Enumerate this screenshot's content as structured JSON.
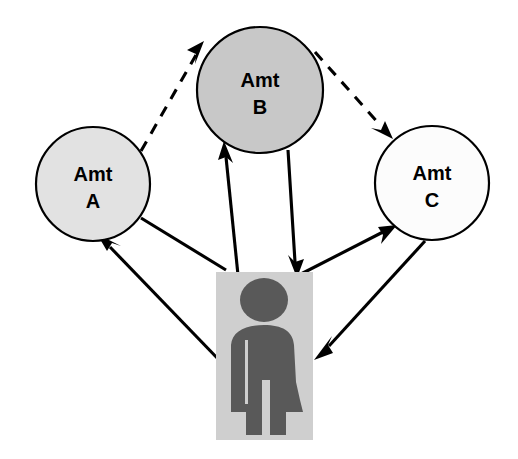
{
  "diagram": {
    "type": "node-link-diagram",
    "background_color": "#ffffff",
    "nodes": [
      {
        "id": "amt-a",
        "label_line1": "Amt",
        "label_line2": "A",
        "shape": "circle",
        "cx": 93,
        "cy": 184,
        "r": 57,
        "fill": "#e2e2e2",
        "stroke": "#000000"
      },
      {
        "id": "amt-b",
        "label_line1": "Amt",
        "label_line2": "B",
        "shape": "circle",
        "cx": 260,
        "cy": 90,
        "r": 63,
        "fill": "#c8c8c8",
        "stroke": "#000000"
      },
      {
        "id": "amt-c",
        "label_line1": "Amt",
        "label_line2": "C",
        "shape": "circle",
        "cx": 432,
        "cy": 183,
        "r": 57,
        "fill": "#fcfcfc",
        "stroke": "#000000"
      }
    ],
    "citizen": {
      "id": "citizen",
      "shape": "rectangle",
      "x": 216,
      "y": 272,
      "width": 97,
      "height": 168,
      "fill": "#cfcfcf",
      "figure_fill": "#595959",
      "icon": "person-icon"
    },
    "edges": [
      {
        "id": "a-to-b",
        "from": "amt-a",
        "to": "amt-b",
        "style": "dashed",
        "arrow": "to",
        "color": "#000000"
      },
      {
        "id": "b-to-c",
        "from": "amt-b",
        "to": "amt-c",
        "style": "dashed",
        "arrow": "to",
        "color": "#000000"
      },
      {
        "id": "a-to-citizen",
        "from": "amt-a",
        "to": "citizen",
        "style": "solid",
        "arrow": "to",
        "color": "#000000"
      },
      {
        "id": "citizen-to-a",
        "from": "citizen",
        "to": "amt-a",
        "style": "solid",
        "arrow": "to",
        "color": "#000000"
      },
      {
        "id": "citizen-to-b",
        "from": "citizen",
        "to": "amt-b",
        "style": "solid",
        "arrow": "to",
        "color": "#000000"
      },
      {
        "id": "b-to-citizen",
        "from": "amt-b",
        "to": "citizen",
        "style": "solid",
        "arrow": "to",
        "color": "#000000"
      },
      {
        "id": "citizen-to-c",
        "from": "citizen",
        "to": "amt-c",
        "style": "solid",
        "arrow": "to",
        "color": "#000000"
      },
      {
        "id": "c-to-citizen",
        "from": "amt-c",
        "to": "citizen",
        "style": "solid",
        "arrow": "to",
        "color": "#000000"
      }
    ]
  }
}
